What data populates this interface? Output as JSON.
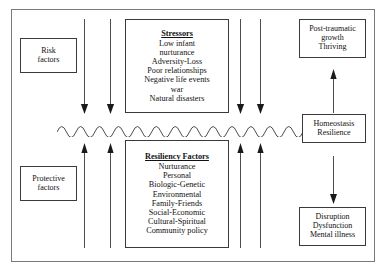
{
  "diagram": {
    "colors": {
      "outer_frame": "#7a7a7a",
      "box_border": "#3a3a3a",
      "line": "#3a3a3a",
      "text": "#111111",
      "background": "#ffffff"
    },
    "boxes": {
      "risk_factors": {
        "lines": [
          "Risk",
          "factors"
        ]
      },
      "protective_factors": {
        "lines": [
          "Protective",
          "factors"
        ]
      },
      "stressors": {
        "heading": "Stressors",
        "items": [
          "Low infant",
          "nurturance",
          "Adversity-Loss",
          "Poor relationships",
          "Negative life events",
          "war",
          "Natural disasters"
        ]
      },
      "resiliency_factors": {
        "heading": "Resiliency Factors",
        "items": [
          "Nurturance",
          "Personal",
          "Biologic-Genetic",
          "Environmental",
          "Family-Friends",
          "Social-Economic",
          "Cultural-Spiritual",
          "Community policy"
        ]
      },
      "post_traumatic": {
        "lines": [
          "Post-traumatic",
          "growth",
          "Thriving"
        ]
      },
      "homeostasis": {
        "lines": [
          "Homeostasis",
          "Resilience"
        ]
      },
      "disruption": {
        "lines": [
          "Disruption",
          "Dysfunction",
          "Mental illness"
        ]
      }
    },
    "arrows": {
      "stressor_down": {
        "icon": "arrow-down-icon",
        "count": 4,
        "direction": "down",
        "x_positions": [
          84,
          110,
          240,
          260
        ],
        "y_top": 19,
        "y_bottom": 114
      },
      "resiliency_up": {
        "icon": "arrow-up-icon",
        "count": 4,
        "direction": "up",
        "x_positions": [
          84,
          110,
          240,
          260
        ],
        "y_top": 143,
        "y_bottom": 248
      },
      "homeostasis_to_growth": {
        "icon": "arrow-up-icon",
        "direction": "up",
        "x": 333,
        "y_top": 69,
        "y_bottom": 112
      },
      "homeostasis_to_disruption": {
        "icon": "arrow-down-icon",
        "direction": "down",
        "x": 333,
        "y_top": 156,
        "y_bottom": 204
      }
    },
    "wavy_line": {
      "name": "homeostasis-wave",
      "cycles": 13,
      "x_start": 57,
      "x_end": 303,
      "y_center": 128
    }
  }
}
